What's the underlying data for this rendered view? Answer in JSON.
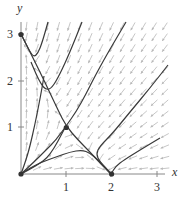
{
  "chart_data": {
    "type": "phase_portrait",
    "title": "",
    "xlabel": "x",
    "ylabel": "y",
    "xlim": [
      0,
      3.2
    ],
    "ylim": [
      0,
      3.2
    ],
    "x_ticks": [
      1,
      2,
      3
    ],
    "y_ticks": [
      1,
      2,
      3
    ],
    "x_tick_labels": [
      "1",
      "2",
      "3"
    ],
    "y_tick_labels": [
      "1",
      "2",
      "3"
    ],
    "grid": false,
    "vector_field": {
      "description": "direction field consistent with competing species equilibria",
      "dx": "x*(2 - x - y)",
      "dy": "y*(3 - y - 2*x)",
      "color": "#b8b8b8"
    },
    "equilibria": [
      {
        "x": 0,
        "y": 0
      },
      {
        "x": 0,
        "y": 3
      },
      {
        "x": 2,
        "y": 0
      },
      {
        "x": 1,
        "y": 1
      }
    ],
    "trajectories_px": [
      [
        [
          21,
          34
        ],
        [
          26,
          44
        ],
        [
          30,
          52
        ],
        [
          34,
          57
        ],
        [
          38,
          53
        ],
        [
          42,
          43
        ],
        [
          48,
          22
        ]
      ],
      [
        [
          21,
          34
        ],
        [
          30,
          52
        ],
        [
          40,
          72
        ],
        [
          50,
          93
        ],
        [
          58,
          110
        ],
        [
          66,
          126
        ],
        [
          78,
          140
        ],
        [
          90,
          152
        ],
        [
          100,
          163
        ],
        [
          111,
          174
        ]
      ],
      [
        [
          31,
          62
        ],
        [
          36,
          74
        ],
        [
          41,
          84
        ],
        [
          46,
          90
        ],
        [
          52,
          88
        ],
        [
          60,
          74
        ],
        [
          70,
          52
        ],
        [
          82,
          22
        ]
      ],
      [
        [
          21,
          174
        ],
        [
          26,
          160
        ],
        [
          30,
          146
        ],
        [
          35,
          124
        ],
        [
          39,
          104
        ],
        [
          42,
          88
        ],
        [
          44,
          76
        ]
      ],
      [
        [
          21,
          174
        ],
        [
          34,
          162
        ],
        [
          46,
          150
        ],
        [
          56,
          140
        ],
        [
          66,
          126
        ],
        [
          76,
          112
        ],
        [
          86,
          94
        ],
        [
          94,
          78
        ],
        [
          106,
          56
        ],
        [
          126,
          22
        ]
      ],
      [
        [
          21,
          174
        ],
        [
          30,
          168
        ],
        [
          42,
          162
        ],
        [
          56,
          157
        ],
        [
          70,
          152
        ],
        [
          82,
          150
        ],
        [
          90,
          153
        ],
        [
          98,
          160
        ],
        [
          105,
          167
        ],
        [
          111,
          174
        ]
      ],
      [
        [
          21,
          174
        ],
        [
          36,
          166
        ],
        [
          50,
          156
        ],
        [
          66,
          126
        ]
      ],
      [
        [
          111,
          174
        ],
        [
          116,
          166
        ],
        [
          124,
          160
        ],
        [
          140,
          150
        ],
        [
          160,
          138
        ]
      ],
      [
        [
          168,
          65
        ],
        [
          150,
          88
        ],
        [
          130,
          112
        ],
        [
          112,
          134
        ],
        [
          100,
          146
        ],
        [
          96,
          154
        ],
        [
          100,
          162
        ],
        [
          111,
          174
        ]
      ]
    ],
    "axes_px": {
      "origin": [
        21,
        174
      ],
      "x_unit": 45.3,
      "y_unit": 46.5,
      "x_end": 165,
      "y_end": 22
    }
  },
  "labels": {
    "x_axis": "x",
    "y_axis": "y",
    "x1": "1",
    "x2": "2",
    "x3": "3",
    "y1": "1",
    "y2": "2",
    "y3": "3"
  }
}
